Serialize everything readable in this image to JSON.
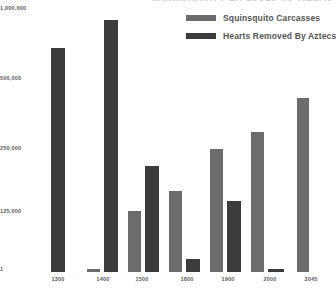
{
  "chart_data": {
    "type": "bar",
    "title": "Squinsquito Carcasses vs Hearts Removed By Aztecs",
    "xlabel": "",
    "ylabel": "",
    "grid": false,
    "legend_position": "top-right",
    "axis_scale": "log-like",
    "categories": [
      "1300",
      "1400",
      "1500",
      "1800",
      "1900",
      "2000",
      "2045"
    ],
    "ytick_labels": [
      "1,000,000",
      "500,000",
      "250,000",
      "125,000",
      "1"
    ],
    "ytick_values": [
      1000000,
      500000,
      250000,
      125000,
      1
    ],
    "ylim": [
      1,
      1000000
    ],
    "series": [
      {
        "name": "Squinsquito Carcasses",
        "color": "#6c6c6c",
        "values": [
          null,
          2000,
          127000,
          155000,
          245000,
          290000,
          420000
        ]
      },
      {
        "name": "Hearts Removed By Aztecs",
        "color": "#3b3b3b",
        "values": [
          700000,
          930000,
          200000,
          25000,
          140000,
          5000,
          null
        ]
      }
    ]
  },
  "legend": {
    "items": [
      {
        "label": "Squinsquito Carcasses",
        "color": "#6c6c6c"
      },
      {
        "label": "Hearts Removed By Aztecs",
        "color": "#3b3b3b"
      }
    ]
  },
  "axes": {
    "y_ticks": [
      {
        "label": "1,000,000",
        "y": 5
      },
      {
        "label": "500,000",
        "y": 75
      },
      {
        "label": "250,000",
        "y": 145
      },
      {
        "label": "125,000",
        "y": 208
      },
      {
        "label": "1",
        "y": 266
      }
    ],
    "x_ticks": [
      {
        "label": "1300"
      },
      {
        "label": "1400"
      },
      {
        "label": "1500"
      },
      {
        "label": "1800"
      },
      {
        "label": "1900"
      },
      {
        "label": "2000"
      },
      {
        "label": "2045"
      }
    ]
  },
  "geometry": {
    "baseline_y": 271,
    "groups": [
      {
        "x": 0,
        "width": 39,
        "bars": [
          {
            "series": 1,
            "left": 6,
            "width": 14,
            "top": 47
          }
        ]
      },
      {
        "x": 41,
        "width": 39,
        "bars": [
          {
            "series": 0,
            "left": 1,
            "width": 13,
            "top": 268
          },
          {
            "series": 1,
            "left": 18,
            "width": 14,
            "top": 19
          }
        ]
      },
      {
        "x": 82,
        "width": 39,
        "bars": [
          {
            "series": 0,
            "left": 1,
            "width": 13,
            "top": 210
          },
          {
            "series": 1,
            "left": 18,
            "width": 14,
            "top": 165
          }
        ]
      },
      {
        "x": 123,
        "width": 39,
        "bars": [
          {
            "series": 0,
            "left": 1,
            "width": 13,
            "top": 190
          },
          {
            "series": 1,
            "left": 18,
            "width": 14,
            "top": 258
          }
        ]
      },
      {
        "x": 164,
        "width": 39,
        "bars": [
          {
            "series": 0,
            "left": 1,
            "width": 13,
            "top": 148
          },
          {
            "series": 1,
            "left": 18,
            "width": 14,
            "top": 200
          }
        ]
      },
      {
        "x": 205,
        "width": 39,
        "bars": [
          {
            "series": 0,
            "left": 1,
            "width": 13,
            "top": 131
          },
          {
            "series": 1,
            "left": 18,
            "width": 16,
            "top": 268
          }
        ]
      },
      {
        "x": 249,
        "width": 39,
        "bars": [
          {
            "series": 0,
            "left": 3,
            "width": 12,
            "top": 97
          }
        ]
      }
    ],
    "x_label_centers": [
      13,
      58,
      97,
      142,
      183,
      225,
      266
    ]
  }
}
